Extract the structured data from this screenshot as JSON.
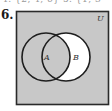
{
  "clipped_previous_line": "4. {2, 4, 6}    5. {1, 3",
  "problem": {
    "number": "6.",
    "diagram": {
      "type": "venn",
      "universe_label": "U",
      "sets": [
        {
          "label": "A"
        },
        {
          "label": "B"
        }
      ],
      "shaded_region_description": "U minus (B − A)",
      "colors": {
        "shade": "#c8c8c8",
        "unshaded": "#ffffff",
        "stroke": "#1e1e1e"
      }
    }
  }
}
